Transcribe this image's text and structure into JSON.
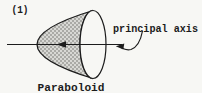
{
  "figure": {
    "index_label": "(1)",
    "axis_label": "principal axis",
    "shape_label": "Paraboloid"
  },
  "colors": {
    "ink": "#1c1c1c",
    "background": "#f7f7f4",
    "shade_fill": "#d8d8d4",
    "shade_dot": "#585854",
    "mouth_fill": "#f7f7f4"
  }
}
